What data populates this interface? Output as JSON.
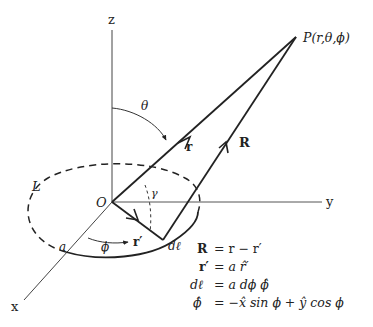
{
  "diagram": {
    "axes": {
      "z_label": "z",
      "y_label": "y",
      "x_label": "x",
      "origin_label": "O"
    },
    "point": {
      "label": "P(r,θ,ϕ)"
    },
    "vectors": {
      "r_label": "r",
      "R_label": "R",
      "r_prime_label": "r′",
      "dl_label": "dℓ"
    },
    "angles": {
      "theta_label": "θ",
      "phi_label": "ϕ",
      "gamma_label": "γ"
    },
    "loop": {
      "label": "L",
      "radius_label": "a"
    },
    "equations": [
      {
        "lhs": "R",
        "rhs": "= r − r′"
      },
      {
        "lhs": "r′",
        "rhs": "= a r̂′"
      },
      {
        "lhs": "dℓ",
        "rhs": "= a dϕ ϕ̂"
      },
      {
        "lhs": "ϕ̂",
        "rhs": "= −x̂ sin ϕ + ŷ cos ϕ"
      }
    ]
  }
}
